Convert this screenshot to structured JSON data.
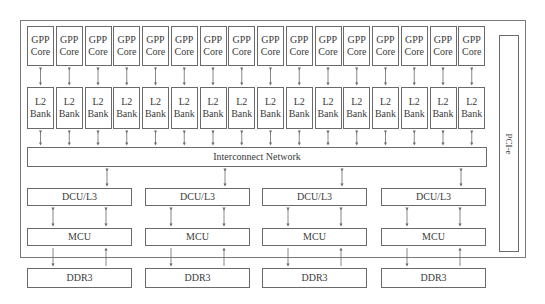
{
  "diagram": {
    "gpp_core_label_line1": "GPP",
    "gpp_core_label_line2": "Core",
    "l2_bank_label_line1": "L2",
    "l2_bank_label_line2": "Bank",
    "core_count": 16,
    "interconnect_label": "Interconnect Network",
    "pcie_label": "PCI-e",
    "memory_channels": [
      {
        "dcu_label": "DCU/L3",
        "mcu_label": "MCU",
        "ddr_label": "DDR3"
      },
      {
        "dcu_label": "DCU/L3",
        "mcu_label": "MCU",
        "ddr_label": "DDR3"
      },
      {
        "dcu_label": "DCU/L3",
        "mcu_label": "MCU",
        "ddr_label": "DDR3"
      },
      {
        "dcu_label": "DCU/L3",
        "mcu_label": "MCU",
        "ddr_label": "DDR3"
      }
    ],
    "colors": {
      "line": "#6a6a6a",
      "text": "#3a3a3a",
      "background": "#ffffff"
    }
  }
}
